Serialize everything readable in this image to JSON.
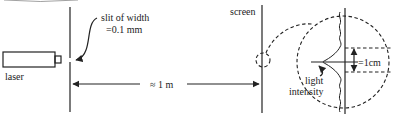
{
  "diagram": {
    "header_partial_text": "",
    "labels": {
      "laser": "laser",
      "slit_line1": "slit of width",
      "slit_line2": "=0.1 mm",
      "distance": "≈ 1 m",
      "screen": "screen",
      "fringe_width": "=1cm",
      "intensity_line1": "light",
      "intensity_line2": "intensity"
    },
    "colors": {
      "ink": "#222222",
      "background": "#ffffff"
    }
  }
}
